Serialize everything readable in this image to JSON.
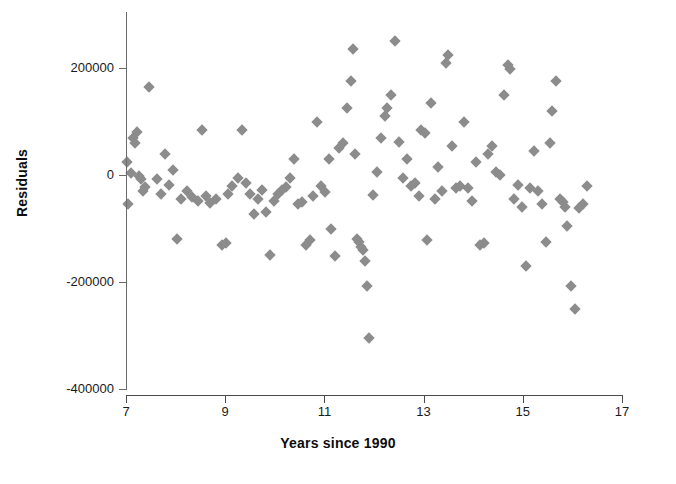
{
  "chart_data": {
    "type": "scatter",
    "title": "",
    "xlabel": "Years since 1990",
    "ylabel": "Residuals",
    "xlim": [
      7,
      17
    ],
    "ylim": [
      -400000,
      280000
    ],
    "xticks": [
      7,
      9,
      11,
      13,
      15,
      17
    ],
    "xtick_labels": [
      "7",
      "9",
      "11",
      "13",
      "15",
      "17"
    ],
    "yticks": [
      200000,
      0,
      -200000,
      -400000
    ],
    "ytick_labels": [
      "200000",
      "0",
      "-200000",
      "-400000"
    ],
    "grid": false,
    "legend": null,
    "marker": "diamond",
    "marker_color": "#8c8c8c",
    "points": [
      [
        7.02,
        25000
      ],
      [
        7.04,
        -55000
      ],
      [
        7.1,
        3000
      ],
      [
        7.14,
        70000
      ],
      [
        7.18,
        60000
      ],
      [
        7.22,
        80000
      ],
      [
        7.26,
        -2000
      ],
      [
        7.3,
        -8000
      ],
      [
        7.34,
        -30000
      ],
      [
        7.38,
        -22000
      ],
      [
        7.46,
        165000
      ],
      [
        7.62,
        -8000
      ],
      [
        7.7,
        -35000
      ],
      [
        7.78,
        40000
      ],
      [
        7.86,
        -18000
      ],
      [
        7.94,
        10000
      ],
      [
        8.02,
        -120000
      ],
      [
        8.1,
        -45000
      ],
      [
        8.22,
        -30000
      ],
      [
        8.34,
        -42000
      ],
      [
        8.46,
        -48000
      ],
      [
        8.54,
        85000
      ],
      [
        8.62,
        -40000
      ],
      [
        8.7,
        -52000
      ],
      [
        8.82,
        -45000
      ],
      [
        8.94,
        -130000
      ],
      [
        9.02,
        -128000
      ],
      [
        9.06,
        -35000
      ],
      [
        9.14,
        -20000
      ],
      [
        9.26,
        -5000
      ],
      [
        9.34,
        85000
      ],
      [
        9.42,
        -15000
      ],
      [
        9.5,
        -35000
      ],
      [
        9.58,
        -72000
      ],
      [
        9.66,
        -45000
      ],
      [
        9.74,
        -28000
      ],
      [
        9.82,
        -70000
      ],
      [
        9.9,
        -150000
      ],
      [
        9.98,
        -48000
      ],
      [
        10.06,
        -35000
      ],
      [
        10.14,
        -28000
      ],
      [
        10.22,
        -22000
      ],
      [
        10.3,
        -5000
      ],
      [
        10.38,
        30000
      ],
      [
        10.46,
        -55000
      ],
      [
        10.54,
        -50000
      ],
      [
        10.62,
        -130000
      ],
      [
        10.7,
        -122000
      ],
      [
        10.78,
        -40000
      ],
      [
        10.86,
        100000
      ],
      [
        10.94,
        -20000
      ],
      [
        11.02,
        -32000
      ],
      [
        11.1,
        30000
      ],
      [
        11.14,
        -100000
      ],
      [
        11.22,
        -152000
      ],
      [
        11.3,
        50000
      ],
      [
        11.38,
        60000
      ],
      [
        11.46,
        125000
      ],
      [
        11.54,
        175000
      ],
      [
        11.58,
        235000
      ],
      [
        11.62,
        40000
      ],
      [
        11.66,
        -120000
      ],
      [
        11.7,
        -125000
      ],
      [
        11.74,
        -135000
      ],
      [
        11.78,
        -140000
      ],
      [
        11.82,
        -160000
      ],
      [
        11.86,
        -208000
      ],
      [
        11.9,
        -305000
      ],
      [
        11.98,
        -38000
      ],
      [
        12.06,
        5000
      ],
      [
        12.14,
        70000
      ],
      [
        12.22,
        110000
      ],
      [
        12.26,
        125000
      ],
      [
        12.34,
        150000
      ],
      [
        12.42,
        250000
      ],
      [
        12.5,
        62000
      ],
      [
        12.58,
        -5000
      ],
      [
        12.66,
        30000
      ],
      [
        12.74,
        -20000
      ],
      [
        12.82,
        -15000
      ],
      [
        12.9,
        -40000
      ],
      [
        12.94,
        85000
      ],
      [
        13.02,
        78000
      ],
      [
        13.06,
        -122000
      ],
      [
        13.14,
        135000
      ],
      [
        13.22,
        -45000
      ],
      [
        13.3,
        15000
      ],
      [
        13.38,
        -30000
      ],
      [
        13.46,
        210000
      ],
      [
        13.5,
        225000
      ],
      [
        13.58,
        55000
      ],
      [
        13.66,
        -25000
      ],
      [
        13.74,
        -20000
      ],
      [
        13.82,
        100000
      ],
      [
        13.9,
        -25000
      ],
      [
        13.98,
        -48000
      ],
      [
        14.06,
        25000
      ],
      [
        14.14,
        -130000
      ],
      [
        14.22,
        -128000
      ],
      [
        14.3,
        40000
      ],
      [
        14.38,
        55000
      ],
      [
        14.46,
        5000
      ],
      [
        14.54,
        0
      ],
      [
        14.62,
        150000
      ],
      [
        14.7,
        205000
      ],
      [
        14.74,
        198000
      ],
      [
        14.82,
        -45000
      ],
      [
        14.9,
        -18000
      ],
      [
        14.98,
        -60000
      ],
      [
        15.06,
        -170000
      ],
      [
        15.14,
        -25000
      ],
      [
        15.22,
        45000
      ],
      [
        15.3,
        -30000
      ],
      [
        15.38,
        -55000
      ],
      [
        15.46,
        -125000
      ],
      [
        15.54,
        60000
      ],
      [
        15.58,
        120000
      ],
      [
        15.66,
        175000
      ],
      [
        15.74,
        -45000
      ],
      [
        15.82,
        -50000
      ],
      [
        15.86,
        -60000
      ],
      [
        15.9,
        -95000
      ],
      [
        15.98,
        -208000
      ],
      [
        16.06,
        -250000
      ],
      [
        16.14,
        -62000
      ],
      [
        16.22,
        -55000
      ],
      [
        16.3,
        -20000
      ]
    ]
  }
}
